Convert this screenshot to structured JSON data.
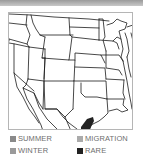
{
  "map": {
    "region": "United States (west-central and south)",
    "range_highlight": "rare",
    "highlight_location": "South Texas"
  },
  "legend": {
    "items": [
      {
        "key": "summer",
        "label": "SUMMER",
        "color": "#8a8a8a"
      },
      {
        "key": "migration",
        "label": "MIGRATION",
        "color": "#ababab"
      },
      {
        "key": "winter",
        "label": "WINTER",
        "color": "#9a9a9a"
      },
      {
        "key": "rare",
        "label": "RARE",
        "color": "#222222"
      }
    ]
  },
  "colors": {
    "border_lines": "#1a1a1a",
    "frame": "#b5b5b5",
    "topbar": "#a8a8a8"
  }
}
